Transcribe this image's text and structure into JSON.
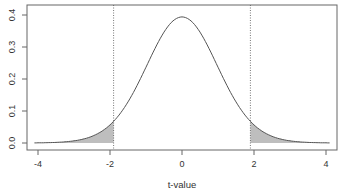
{
  "chart_data": {
    "type": "area",
    "title": "",
    "xlabel": "t-value",
    "ylabel": "",
    "xlim": [
      -4.3,
      4.3
    ],
    "ylim": [
      -0.02,
      0.43
    ],
    "x_ticks": [
      -4,
      -2,
      0,
      2,
      4
    ],
    "x_tick_labels": [
      "-4",
      "-2",
      "0",
      "2",
      "4"
    ],
    "y_ticks": [
      0.0,
      0.1,
      0.2,
      0.3,
      0.4
    ],
    "y_tick_labels": [
      "0.0",
      "0.1",
      "0.2",
      "0.3",
      "0.4"
    ],
    "grid": false,
    "legend": null,
    "series": [
      {
        "name": "t density",
        "x": [
          -4.1,
          -3.5,
          -3.0,
          -2.5,
          -2.0,
          -1.9,
          -1.5,
          -1.0,
          -0.5,
          0.0,
          0.5,
          1.0,
          1.5,
          1.9,
          2.0,
          2.5,
          3.0,
          3.5,
          4.1
        ],
        "values": [
          0.0005,
          0.0012,
          0.0051,
          0.0193,
          0.056,
          0.066,
          0.129,
          0.241,
          0.351,
          0.394,
          0.351,
          0.241,
          0.129,
          0.066,
          0.056,
          0.0193,
          0.0051,
          0.0012,
          0.0005
        ]
      }
    ],
    "critical_values": [
      -1.9,
      1.9
    ],
    "shaded_regions": [
      {
        "from": -4.1,
        "to": -1.9,
        "color": "#bebebe"
      },
      {
        "from": 1.9,
        "to": 4.1,
        "color": "#bebebe"
      }
    ],
    "annotations": [
      "dotted vertical lines at critical t-values"
    ]
  },
  "colors": {
    "curve": "#555555",
    "shade": "#bebebe",
    "axis": "#555555"
  }
}
